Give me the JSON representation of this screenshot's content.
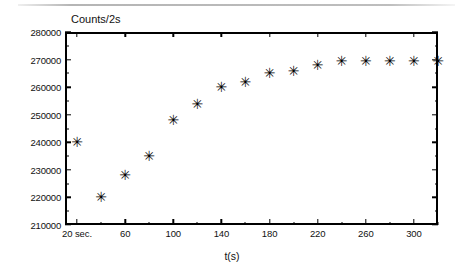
{
  "figure": {
    "name": "counts-vs-time-saturation-plot",
    "y_axis_title": "Counts/2s",
    "x_axis_title": "t(s)",
    "marker_glyph": "✳",
    "marker_color": "#000000",
    "frame_color": "#000000",
    "background_color": "#ffffff"
  },
  "chart_data": {
    "type": "scatter",
    "title": "",
    "subtitle": "",
    "xlabel": "t(s)",
    "ylabel": "Counts/2s",
    "xlim": [
      10,
      320
    ],
    "ylim": [
      210000,
      280000
    ],
    "grid": false,
    "legend": null,
    "marker": "asterisk",
    "x": [
      20,
      40,
      60,
      80,
      100,
      120,
      140,
      160,
      180,
      200,
      220,
      240,
      260,
      280,
      300,
      320
    ],
    "values": [
      240000,
      220000,
      228000,
      235000,
      248000,
      254000,
      260000,
      262000,
      265000,
      266000,
      268000,
      269500,
      269500,
      269500,
      269500,
      269500
    ],
    "x_tick_labels": [
      "20 sec.",
      "60",
      "100",
      "140",
      "180",
      "220",
      "260",
      "300"
    ],
    "x_tick_values": [
      20,
      60,
      100,
      140,
      180,
      220,
      260,
      300
    ],
    "x_minor_tick_values": [
      40,
      80,
      120,
      160,
      200,
      240,
      280,
      320
    ],
    "y_tick_labels": [
      "280000",
      "270000",
      "260000",
      "250000",
      "240000",
      "230000",
      "220000",
      "210000"
    ],
    "y_tick_values": [
      280000,
      270000,
      260000,
      250000,
      240000,
      230000,
      220000,
      210000
    ],
    "y_minor_tick_values": [
      275000,
      265000,
      255000,
      245000,
      235000,
      225000,
      215000
    ],
    "points": [
      {
        "x": 20,
        "y": 240000
      },
      {
        "x": 40,
        "y": 220000
      },
      {
        "x": 60,
        "y": 228000
      },
      {
        "x": 80,
        "y": 235000
      },
      {
        "x": 100,
        "y": 248000
      },
      {
        "x": 120,
        "y": 254000
      },
      {
        "x": 140,
        "y": 260000
      },
      {
        "x": 160,
        "y": 262000
      },
      {
        "x": 180,
        "y": 265000
      },
      {
        "x": 200,
        "y": 266000
      },
      {
        "x": 220,
        "y": 268000
      },
      {
        "x": 240,
        "y": 269500
      },
      {
        "x": 260,
        "y": 269500
      },
      {
        "x": 280,
        "y": 269500
      },
      {
        "x": 300,
        "y": 269500
      },
      {
        "x": 320,
        "y": 269500
      }
    ]
  }
}
